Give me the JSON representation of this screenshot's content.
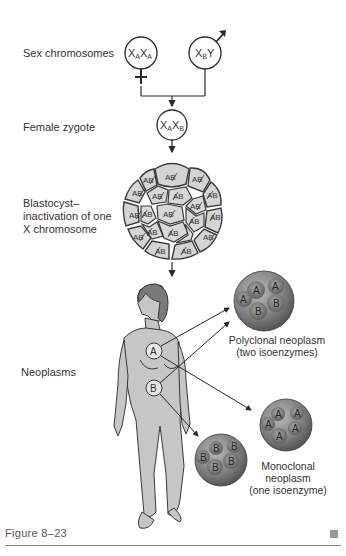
{
  "figure": {
    "label": "Figure 8–23",
    "end_marker": "square"
  },
  "rows": {
    "sex_chromosomes": "Sex chromosomes",
    "female_zygote": "Female zygote",
    "blastocyst_line1": "Blastocyst–",
    "blastocyst_line2": "inactivation of one",
    "blastocyst_line3": "X chromosome",
    "neoplasms": "Neoplasms"
  },
  "parents": {
    "female": {
      "x1": "X",
      "s1": "A",
      "x2": "X",
      "s2": "A",
      "symbol": "female-symbol"
    },
    "male": {
      "x1": "X",
      "s1": "B",
      "y": "Y",
      "symbol": "male-symbol"
    }
  },
  "zygote": {
    "x1": "X",
    "s1": "A",
    "x2": "X",
    "s2": "B"
  },
  "blastocyst": {
    "cell_text": "AB",
    "cells": 19,
    "note": "Each cell shows AB with one letter struck through (inactivated X)"
  },
  "body_sites": {
    "site_a": "A",
    "site_b": "B"
  },
  "neoplasms": {
    "polyclonal": {
      "title": "Polyclonal neoplasm",
      "subtitle": "(two isoenzymes)",
      "cells": [
        "A",
        "A",
        "A",
        "B",
        "B"
      ]
    },
    "monoclonal_a": {
      "cells": [
        "A",
        "A",
        "A",
        "A",
        "A"
      ]
    },
    "monoclonal_b": {
      "cells": [
        "B",
        "B",
        "B",
        "B",
        "B"
      ]
    },
    "monoclonal_caption": {
      "line1": "Monoclonal",
      "line2": "neoplasm",
      "line3": "(one isoenzyme)"
    }
  },
  "colors": {
    "line": "#2a2a2a",
    "cell_fill": "#d4d4d4",
    "cell_stroke": "#3a3a3a",
    "body_fill": "#c6c6c6",
    "hair_fill": "#7a7a7a",
    "sphere_fill": "#8a8a8a",
    "sphere_dark": "#5e5e5e"
  }
}
